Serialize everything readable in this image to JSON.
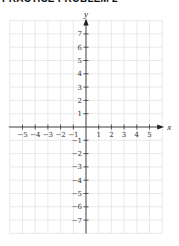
{
  "title": "PRACTICE PROBLEM 2",
  "chart_data": {
    "type": "scatter",
    "title": "PRACTICE PROBLEM 2",
    "xlabel": "x",
    "ylabel": "y",
    "xlim": [
      -6,
      6
    ],
    "ylim": [
      -8,
      8
    ],
    "xticks": [
      -5,
      -4,
      -3,
      -2,
      -1,
      1,
      2,
      3,
      4,
      5
    ],
    "yticks": [
      7,
      6,
      5,
      4,
      3,
      2,
      1,
      -1,
      -2,
      -3,
      -4,
      -5,
      -6,
      -7
    ],
    "grid": true,
    "series": []
  },
  "colors": {
    "grid": "#e3e3e3",
    "axis": "#333333",
    "title": "#111111"
  }
}
